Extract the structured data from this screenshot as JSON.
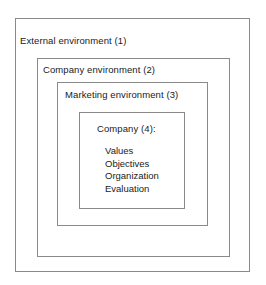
{
  "diagram": {
    "type": "nested-boxes",
    "border_color": "#8a8a8a",
    "background_color": "#ffffff",
    "text_color": "#1a1a1a",
    "levels": [
      {
        "label": "External environment (1)"
      },
      {
        "label": "Company environment (2)"
      },
      {
        "label": "Marketing environment (3)"
      },
      {
        "label": "Company (4):"
      }
    ],
    "company_items": [
      "Values",
      "Objectives",
      "Organization",
      "Evaluation"
    ]
  }
}
